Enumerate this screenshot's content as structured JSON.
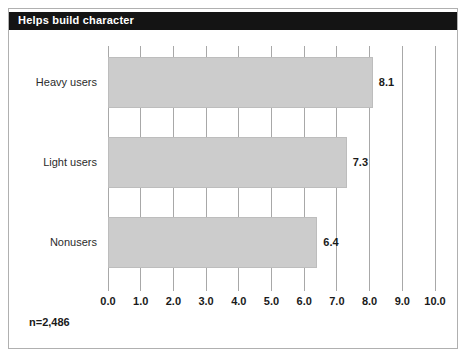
{
  "figure": {
    "title": "Helps build character",
    "footnote": "n=2,486",
    "colors": {
      "title_bar_bg": "#141414",
      "title_text": "#ffffff",
      "bar_fill": "#cccccc",
      "bar_edge": "#bdbdbd",
      "gridline": "#a8a8a8",
      "frame_border": "#b0b0b0",
      "background": "#ffffff"
    }
  },
  "chart_data": {
    "type": "bar",
    "orientation": "horizontal",
    "title": "Helps build character",
    "categories": [
      "Heavy users",
      "Light users",
      "Nonusers"
    ],
    "values": [
      8.1,
      7.3,
      6.4
    ],
    "value_labels": [
      "8.1",
      "7.3",
      "6.4"
    ],
    "xlabel": "",
    "ylabel": "",
    "xlim": [
      0.0,
      10.0
    ],
    "xticks": [
      0.0,
      1.0,
      2.0,
      3.0,
      4.0,
      5.0,
      6.0,
      7.0,
      8.0,
      9.0,
      10.0
    ],
    "xtick_labels": [
      "0.0",
      "1.0",
      "2.0",
      "3.0",
      "4.0",
      "5.0",
      "6.0",
      "7.0",
      "8.0",
      "9.0",
      "10.0"
    ],
    "grid": true,
    "grid_axis": "x",
    "legend": false,
    "annotation": "n=2,486"
  }
}
